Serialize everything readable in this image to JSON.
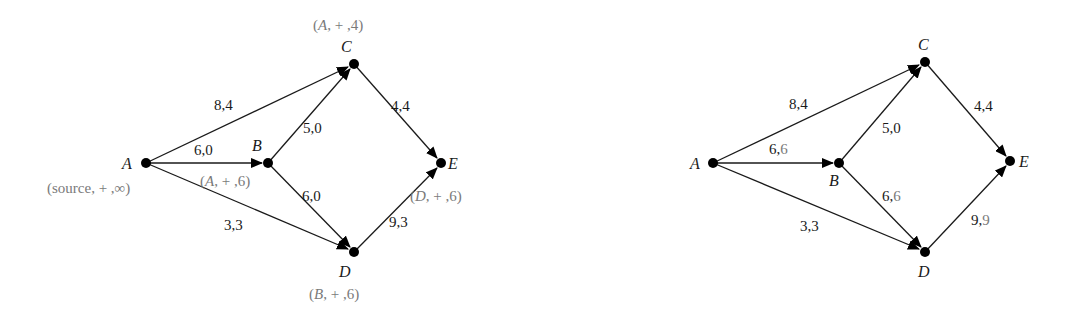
{
  "diagrams": [
    {
      "id": "left",
      "description": "Flow network with labels during augmenting path search",
      "nodes": {
        "A": {
          "name": "A",
          "label": [
            "(source, + ,",
            "∞",
            ")"
          ]
        },
        "B": {
          "name": "B",
          "label": [
            "(",
            "A",
            ", + ,6)"
          ]
        },
        "C": {
          "name": "C",
          "label": [
            "(",
            "A",
            ", + ,4)"
          ]
        },
        "D": {
          "name": "D",
          "label": [
            "(",
            "B",
            ", + ,6)"
          ]
        },
        "E": {
          "name": "E",
          "label": [
            "(",
            "D",
            ", + ,6)"
          ]
        }
      },
      "edges": {
        "AC": {
          "from": "A",
          "to": "C",
          "capacity": "8",
          "flow": "4",
          "text": "8,4"
        },
        "AB": {
          "from": "A",
          "to": "B",
          "capacity": "6",
          "flow": "0",
          "text": "6,0"
        },
        "AD": {
          "from": "A",
          "to": "D",
          "capacity": "3",
          "flow": "3",
          "text": "3,3"
        },
        "BC": {
          "from": "B",
          "to": "C",
          "capacity": "5",
          "flow": "0",
          "text": "5,0"
        },
        "BD": {
          "from": "B",
          "to": "D",
          "capacity": "6",
          "flow": "0",
          "text": "6,0"
        },
        "CE": {
          "from": "C",
          "to": "E",
          "capacity": "4",
          "flow": "4",
          "text": "4,4"
        },
        "DE": {
          "from": "D",
          "to": "E",
          "capacity": "9",
          "flow": "3",
          "text": "9,3"
        }
      }
    },
    {
      "id": "right",
      "description": "Flow network after augmenting along A-B-D-E by 6",
      "nodes": {
        "A": {
          "name": "A"
        },
        "B": {
          "name": "B"
        },
        "C": {
          "name": "C"
        },
        "D": {
          "name": "D"
        },
        "E": {
          "name": "E"
        }
      },
      "edges": {
        "AC": {
          "from": "A",
          "to": "C",
          "capacity": "8",
          "flow": "4",
          "cap_text": "8,",
          "flow_text": "4",
          "flow_updated": false
        },
        "AB": {
          "from": "A",
          "to": "B",
          "capacity": "6",
          "flow": "6",
          "cap_text": "6,",
          "flow_text": "6",
          "flow_updated": true
        },
        "AD": {
          "from": "A",
          "to": "D",
          "capacity": "3",
          "flow": "3",
          "cap_text": "3,",
          "flow_text": "3",
          "flow_updated": false
        },
        "BC": {
          "from": "B",
          "to": "C",
          "capacity": "5",
          "flow": "0",
          "cap_text": "5,",
          "flow_text": "0",
          "flow_updated": false
        },
        "BD": {
          "from": "B",
          "to": "D",
          "capacity": "6",
          "flow": "6",
          "cap_text": "6,",
          "flow_text": "6",
          "flow_updated": true
        },
        "CE": {
          "from": "C",
          "to": "E",
          "capacity": "4",
          "flow": "4",
          "cap_text": "4,",
          "flow_text": "4",
          "flow_updated": false
        },
        "DE": {
          "from": "D",
          "to": "E",
          "capacity": "9",
          "flow": "9",
          "cap_text": "9,",
          "flow_text": "9",
          "flow_updated": true
        }
      }
    }
  ],
  "colors": {
    "edge": "#1a1a1a",
    "node": "#000000",
    "label_tag": "#7a7a7a",
    "updated_flow": "#7a7a7a"
  }
}
